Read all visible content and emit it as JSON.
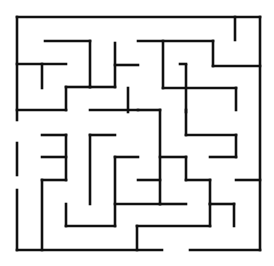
{
  "maze": {
    "stroke_color": "#111111",
    "background": "#ffffff",
    "bounds": {
      "left": 17,
      "top": 17,
      "right": 260,
      "bottom": 250
    },
    "entrance": {
      "side": "bottom",
      "gap_x": [
        162,
        190
      ]
    },
    "walls": [
      [
        17,
        17,
        260,
        17
      ],
      [
        260,
        17,
        260,
        250
      ],
      [
        17,
        17,
        17,
        120
      ],
      [
        17,
        143,
        17,
        175
      ],
      [
        17,
        190,
        17,
        250
      ],
      [
        17,
        250,
        162,
        250
      ],
      [
        190,
        250,
        260,
        250
      ],
      [
        45,
        41,
        90,
        41
      ],
      [
        90,
        41,
        90,
        87
      ],
      [
        17,
        64,
        66,
        64
      ],
      [
        42,
        64,
        42,
        88
      ],
      [
        66,
        87,
        90,
        87
      ],
      [
        66,
        87,
        66,
        110
      ],
      [
        17,
        110,
        66,
        110
      ],
      [
        90,
        87,
        115,
        87
      ],
      [
        115,
        43,
        115,
        87
      ],
      [
        115,
        65,
        138,
        65
      ],
      [
        138,
        41,
        213,
        41
      ],
      [
        163,
        41,
        163,
        88
      ],
      [
        213,
        41,
        213,
        66
      ],
      [
        213,
        66,
        260,
        66
      ],
      [
        235,
        17,
        235,
        40
      ],
      [
        163,
        88,
        236,
        88
      ],
      [
        186,
        65,
        186,
        112
      ],
      [
        236,
        88,
        236,
        110
      ],
      [
        90,
        110,
        138,
        110
      ],
      [
        128,
        88,
        128,
        112
      ],
      [
        42,
        157,
        66,
        157
      ],
      [
        42,
        135,
        66,
        135
      ],
      [
        66,
        135,
        66,
        180
      ],
      [
        90,
        135,
        115,
        135
      ],
      [
        90,
        135,
        90,
        204
      ],
      [
        115,
        157,
        138,
        157
      ],
      [
        115,
        157,
        115,
        226
      ],
      [
        138,
        110,
        160,
        110
      ],
      [
        160,
        110,
        160,
        204
      ],
      [
        160,
        157,
        186,
        157
      ],
      [
        186,
        157,
        186,
        180
      ],
      [
        186,
        180,
        210,
        180
      ],
      [
        210,
        180,
        210,
        204
      ],
      [
        186,
        135,
        236,
        135
      ],
      [
        186,
        135,
        186,
        110
      ],
      [
        160,
        204,
        186,
        204
      ],
      [
        210,
        157,
        236,
        157
      ],
      [
        236,
        135,
        236,
        157
      ],
      [
        236,
        180,
        260,
        180
      ],
      [
        210,
        204,
        234,
        204
      ],
      [
        234,
        204,
        234,
        226
      ],
      [
        42,
        180,
        66,
        180
      ],
      [
        42,
        180,
        42,
        250
      ],
      [
        66,
        204,
        66,
        226
      ],
      [
        66,
        226,
        115,
        226
      ],
      [
        137,
        226,
        210,
        226
      ],
      [
        137,
        226,
        137,
        250
      ],
      [
        210,
        204,
        210,
        226
      ],
      [
        138,
        180,
        160,
        180
      ],
      [
        115,
        204,
        160,
        204
      ],
      [
        180,
        64,
        186,
        64
      ]
    ]
  }
}
